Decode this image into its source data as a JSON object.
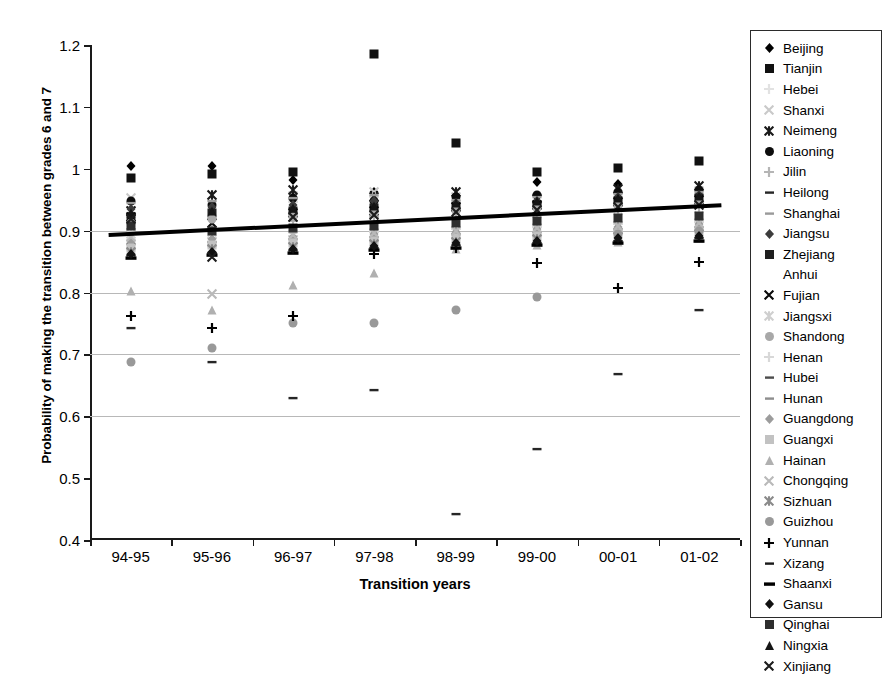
{
  "chart_data": {
    "type": "scatter",
    "title": "",
    "xlabel": "Transition years",
    "ylabel": "Probability of making the transition between grades 6 and 7",
    "categories": [
      "94-95",
      "95-96",
      "96-97",
      "97-98",
      "98-99",
      "99-00",
      "00-01",
      "01-02"
    ],
    "ylim": [
      0.4,
      1.2
    ],
    "yticks": [
      "0.4",
      "0.5",
      "0.6",
      "0.7",
      "0.8",
      "0.9",
      "1",
      "1.1",
      "1.2"
    ],
    "ytick_values": [
      0.4,
      0.5,
      0.6,
      0.7,
      0.8,
      0.9,
      1.0,
      1.1,
      1.2
    ],
    "gridlines": [
      0.6,
      0.7,
      0.8,
      0.9
    ],
    "legend_position": "right",
    "trendline": {
      "label": "linear trend",
      "start": 0.893,
      "end": 0.941,
      "color": "#000000"
    },
    "series": [
      {
        "name": "Beijing",
        "marker": "diamond",
        "color": "#000000",
        "values": [
          1.005,
          1.005,
          0.982,
          0.962,
          0.948,
          0.978,
          0.975,
          0.968
        ]
      },
      {
        "name": "Tianjin",
        "marker": "square",
        "color": "#111111",
        "values": [
          0.985,
          0.992,
          0.995,
          1.185,
          1.042,
          0.995,
          1.002,
          1.012
        ]
      },
      {
        "name": "Hebei",
        "marker": "plus",
        "color": "#e2e2e2",
        "values": [
          0.938,
          0.948,
          0.946,
          0.955,
          0.944,
          0.941,
          0.949,
          0.957
        ]
      },
      {
        "name": "Shanxi",
        "marker": "x",
        "color": "#c9c9c9",
        "values": [
          0.952,
          0.958,
          0.956,
          0.962,
          0.955,
          0.952,
          0.958,
          0.964
        ]
      },
      {
        "name": "Neimeng",
        "marker": "bowtie",
        "color": "#1a1a1a",
        "values": [
          0.932,
          0.958,
          0.965,
          0.955,
          0.962,
          0.951,
          0.968,
          0.972
        ]
      },
      {
        "name": "Liaoning",
        "marker": "circle",
        "color": "#0d0d0d",
        "values": [
          0.948,
          0.942,
          0.952,
          0.948,
          0.955,
          0.958,
          0.962,
          0.966
        ]
      },
      {
        "name": "Jilin",
        "marker": "plus",
        "color": "#b5b5b5",
        "values": [
          0.902,
          0.905,
          0.915,
          0.922,
          0.918,
          0.928,
          0.932,
          0.938
        ]
      },
      {
        "name": "Heilong",
        "marker": "dash",
        "color": "#262626",
        "values": [
          0.742,
          0.688,
          0.63,
          0.643,
          0.442,
          0.547,
          0.668,
          0.772
        ]
      },
      {
        "name": "Shanghai",
        "marker": "dash",
        "color": "#9a9a9a",
        "values": [
          0.944,
          0.948,
          0.952,
          0.958,
          0.95,
          0.955,
          0.96,
          0.963
        ]
      },
      {
        "name": "Jiangsu",
        "marker": "diamond",
        "color": "#3c3c3c",
        "values": [
          0.935,
          0.938,
          0.942,
          0.948,
          0.944,
          0.948,
          0.955,
          0.958
        ]
      },
      {
        "name": "Zhejiang",
        "marker": "square",
        "color": "#1f1f1f",
        "values": [
          0.922,
          0.928,
          0.932,
          0.936,
          0.938,
          0.942,
          0.948,
          0.952
        ]
      },
      {
        "name": "Anhui",
        "marker": "none",
        "color": "#ffffff",
        "values": [
          0.9,
          0.905,
          0.908,
          0.912,
          0.915,
          0.918,
          0.922,
          0.925
        ]
      },
      {
        "name": "Fujian",
        "marker": "x",
        "color": "#0a0a0a",
        "values": [
          0.922,
          0.912,
          0.928,
          0.932,
          0.938,
          0.942,
          0.946,
          0.95
        ]
      },
      {
        "name": "Jiangsxi",
        "marker": "bowtie",
        "color": "#cfcfcf",
        "values": [
          0.895,
          0.898,
          0.902,
          0.908,
          0.912,
          0.916,
          0.92,
          0.924
        ]
      },
      {
        "name": "Shandong",
        "marker": "circle",
        "color": "#a8a8a8",
        "values": [
          0.912,
          0.918,
          0.922,
          0.928,
          0.932,
          0.936,
          0.94,
          0.944
        ]
      },
      {
        "name": "Henan",
        "marker": "plus",
        "color": "#d8d8d8",
        "values": [
          0.885,
          0.888,
          0.892,
          0.898,
          0.902,
          0.906,
          0.91,
          0.914
        ]
      },
      {
        "name": "Hubei",
        "marker": "dash",
        "color": "#4d4d4d",
        "values": [
          0.878,
          0.882,
          0.886,
          0.89,
          0.894,
          0.898,
          0.902,
          0.906
        ]
      },
      {
        "name": "Hunan",
        "marker": "dash",
        "color": "#8e8e8e",
        "values": [
          0.87,
          0.875,
          0.88,
          0.884,
          0.888,
          0.892,
          0.896,
          0.9
        ]
      },
      {
        "name": "Guangdong",
        "marker": "diamond",
        "color": "#9c9c9c",
        "values": [
          0.882,
          0.886,
          0.89,
          0.894,
          0.898,
          0.902,
          0.906,
          0.91
        ]
      },
      {
        "name": "Guangxi",
        "marker": "square",
        "color": "#c2c2c2",
        "values": [
          0.872,
          0.876,
          0.88,
          0.884,
          0.888,
          0.892,
          0.896,
          0.9
        ]
      },
      {
        "name": "Hainan",
        "marker": "triangle",
        "color": "#b0b0b0",
        "values": [
          0.802,
          0.772,
          0.812,
          0.832,
          0.87,
          0.876,
          0.882,
          0.888
        ]
      },
      {
        "name": "Chongqing",
        "marker": "x",
        "color": "#b9b9b9",
        "values": [
          0.89,
          0.798,
          0.893,
          0.896,
          0.9,
          0.904,
          0.908,
          0.912
        ]
      },
      {
        "name": "Sizhuan",
        "marker": "bowtie",
        "color": "#8a8a8a",
        "values": [
          0.866,
          0.87,
          0.874,
          0.878,
          0.882,
          0.886,
          0.89,
          0.894
        ]
      },
      {
        "name": "Guizhou",
        "marker": "circle",
        "color": "#999999",
        "values": [
          0.688,
          0.71,
          0.75,
          0.75,
          0.772,
          0.793,
          0.895,
          0.9
        ]
      },
      {
        "name": "Yunnan",
        "marker": "plus",
        "color": "#000000",
        "values": [
          0.762,
          0.742,
          0.762,
          0.862,
          0.872,
          0.848,
          0.808,
          0.85
        ]
      },
      {
        "name": "Xizang",
        "marker": "dash",
        "color": "#1a1a1a",
        "values": [
          0.86,
          0.864,
          0.868,
          0.872,
          0.876,
          0.88,
          0.884,
          0.888
        ]
      },
      {
        "name": "Shaanxi",
        "marker": "thickdash",
        "color": "#000000",
        "values": [
          0.856,
          0.86,
          0.864,
          0.868,
          0.872,
          0.876,
          0.88,
          0.884
        ]
      },
      {
        "name": "Gansu",
        "marker": "diamond",
        "color": "#111111",
        "values": [
          0.862,
          0.866,
          0.87,
          0.875,
          0.88,
          0.884,
          0.888,
          0.892
        ]
      },
      {
        "name": "Qinghai",
        "marker": "square",
        "color": "#2e2e2e",
        "values": [
          0.908,
          0.9,
          0.904,
          0.908,
          0.912,
          0.916,
          0.92,
          0.924
        ]
      },
      {
        "name": "Ningxia",
        "marker": "triangle",
        "color": "#151515",
        "values": [
          0.928,
          0.932,
          0.936,
          0.94,
          0.944,
          0.948,
          0.952,
          0.956
        ]
      },
      {
        "name": "Xinjiang",
        "marker": "x",
        "color": "#1c1c1c",
        "values": [
          0.918,
          0.858,
          0.922,
          0.926,
          0.93,
          0.934,
          0.938,
          0.942
        ]
      }
    ]
  }
}
